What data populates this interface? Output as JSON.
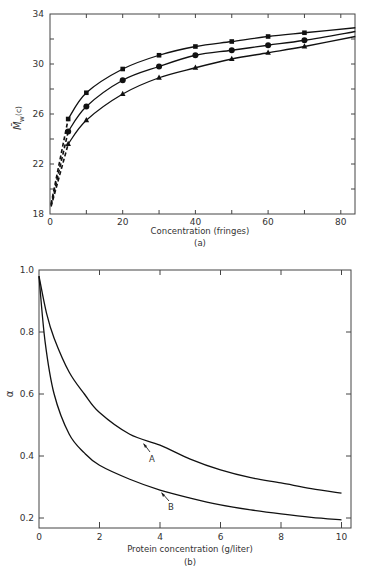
{
  "chart_data": [
    {
      "type": "line",
      "panel": "(a)",
      "title": "",
      "xlabel": "Concentration (fringes)",
      "ylabel": "M̄w(c)",
      "xlim": [
        0,
        84
      ],
      "ylim": [
        18,
        34
      ],
      "xticks": [
        0,
        20,
        40,
        60,
        80
      ],
      "yticks": [
        18,
        22,
        26,
        30,
        34
      ],
      "grid": false,
      "legend": null,
      "series": [
        {
          "name": "squares",
          "marker": "square",
          "x": [
            5,
            10,
            20,
            30,
            40,
            50,
            60,
            70
          ],
          "values": [
            25.6,
            27.7,
            29.6,
            30.7,
            31.4,
            31.8,
            32.2,
            32.5
          ],
          "curve_end": [
            84,
            32.9
          ],
          "extrapolated_intercept": 18.8
        },
        {
          "name": "circles",
          "marker": "circle",
          "x": [
            5,
            10,
            20,
            30,
            40,
            50,
            60,
            70
          ],
          "values": [
            24.6,
            26.6,
            28.7,
            29.8,
            30.7,
            31.1,
            31.5,
            31.9
          ],
          "curve_end": [
            84,
            32.6
          ],
          "extrapolated_intercept": 18.7
        },
        {
          "name": "triangles",
          "marker": "triangle",
          "x": [
            5,
            10,
            20,
            30,
            40,
            50,
            60,
            70
          ],
          "values": [
            23.6,
            25.5,
            27.6,
            28.9,
            29.7,
            30.4,
            30.9,
            31.4
          ],
          "curve_end": [
            84,
            32.2
          ],
          "extrapolated_intercept": 18.6
        }
      ]
    },
    {
      "type": "line",
      "panel": "(b)",
      "title": "",
      "xlabel": "Protein concentration (g/liter)",
      "ylabel": "α",
      "xlim": [
        0,
        10.3
      ],
      "ylim": [
        0.17,
        1.0
      ],
      "xticks": [
        0,
        2,
        4,
        6,
        8,
        10
      ],
      "yticks": [
        0.2,
        0.4,
        0.6,
        0.8,
        1.0
      ],
      "grid": false,
      "legend": null,
      "annotations": [
        "A",
        "B"
      ],
      "series": [
        {
          "name": "A",
          "x": [
            0,
            0.25,
            0.5,
            1,
            1.5,
            2,
            3,
            4,
            5,
            6,
            7,
            8,
            9,
            10
          ],
          "values": [
            0.98,
            0.86,
            0.78,
            0.67,
            0.6,
            0.54,
            0.47,
            0.435,
            0.39,
            0.355,
            0.33,
            0.313,
            0.295,
            0.28
          ]
        },
        {
          "name": "B",
          "x": [
            0,
            0.2,
            0.5,
            1,
            1.5,
            2,
            3,
            4,
            5,
            6,
            7,
            8,
            9,
            10
          ],
          "values": [
            0.98,
            0.77,
            0.6,
            0.47,
            0.41,
            0.37,
            0.325,
            0.29,
            0.264,
            0.242,
            0.226,
            0.213,
            0.202,
            0.194
          ]
        }
      ]
    }
  ],
  "labels": {
    "top": {
      "xlabel": "Concentration (fringes)",
      "panel": "(a)",
      "ylabel_main": "M̄",
      "ylabel_sub": "w",
      "ylabel_arg": "(c)",
      "xticks": [
        "0",
        "20",
        "40",
        "60",
        "80"
      ],
      "yticks": [
        "18",
        "22",
        "26",
        "30",
        "34"
      ]
    },
    "bottom": {
      "xlabel": "Protein concentration (g/liter)",
      "panel": "(b)",
      "ylabel": "α",
      "xticks": [
        "0",
        "2",
        "4",
        "6",
        "8",
        "10"
      ],
      "yticks": [
        "0.2",
        "0.4",
        "0.6",
        "0.8",
        "1.0"
      ],
      "curve_a": "A",
      "curve_b": "B"
    }
  }
}
